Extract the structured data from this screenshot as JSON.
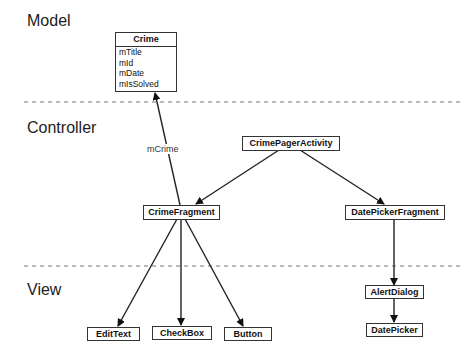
{
  "layers": {
    "model": "Model",
    "controller": "Controller",
    "view": "View"
  },
  "model_class": {
    "name": "Crime",
    "fields": [
      "mTitle",
      "mId",
      "mDate",
      "mIsSolved"
    ]
  },
  "nodes": {
    "crime_pager_activity": "CrimePagerActivity",
    "crime_fragment": "CrimeFragment",
    "date_picker_fragment": "DatePickerFragment",
    "alert_dialog": "AlertDialog",
    "date_picker": "DatePicker",
    "edit_text": "EditText",
    "check_box": "CheckBox",
    "button": "Button"
  },
  "edges": {
    "crime_fragment_to_crime_label": "mCrime"
  },
  "colors": {
    "line": "#222222",
    "dash": "#777777",
    "background": "#ffffff"
  }
}
